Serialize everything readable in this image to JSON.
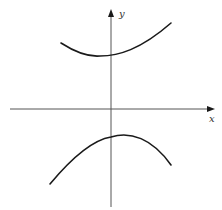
{
  "diagram": {
    "type": "coordinate-graph",
    "axes": {
      "x_label": "x",
      "y_label": "y",
      "color": "#555555"
    },
    "curves": [
      {
        "name": "upper-branch",
        "shape": "concave-up",
        "color": "#1a1a1a"
      },
      {
        "name": "lower-branch",
        "shape": "concave-down",
        "color": "#1a1a1a"
      }
    ]
  }
}
